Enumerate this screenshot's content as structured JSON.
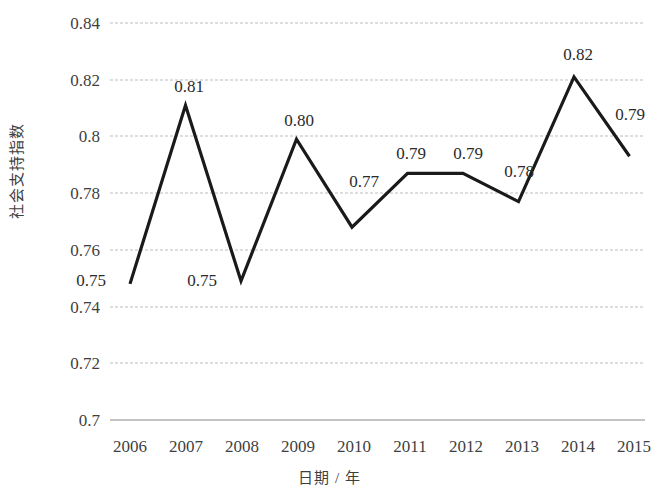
{
  "chart_data": {
    "type": "line",
    "title": "",
    "xlabel": "日期 / 年",
    "ylabel": "社会支持指数",
    "categories": [
      "2006",
      "2007",
      "2008",
      "2009",
      "2010",
      "2011",
      "2012",
      "2013",
      "2014",
      "2015"
    ],
    "values": [
      0.748,
      0.811,
      0.749,
      0.799,
      0.768,
      0.787,
      0.787,
      0.777,
      0.821,
      0.793
    ],
    "point_labels": [
      "0.75",
      "0.81",
      "0.75",
      "0.80",
      "0.77",
      "0.79",
      "0.79",
      "0.78",
      "0.82",
      "0.79"
    ],
    "ylim": [
      0.7,
      0.84
    ],
    "yticks": [
      0.7,
      0.72,
      0.74,
      0.76,
      0.78,
      0.8,
      0.82,
      0.84
    ],
    "ytick_labels": [
      "0.7",
      "0.72",
      "0.74",
      "0.76",
      "0.78",
      "0.8",
      "0.82",
      "0.84"
    ],
    "grid": true,
    "legend": "none",
    "line_color": "#1a1a1a",
    "grid_color": "#b9b9b9",
    "series": [
      {
        "name": "社会支持指数",
        "values": [
          0.748,
          0.811,
          0.749,
          0.799,
          0.768,
          0.787,
          0.787,
          0.777,
          0.821,
          0.793
        ]
      }
    ]
  },
  "axis": {
    "y_title": "社会支持指数",
    "x_title": "日期 / 年"
  }
}
